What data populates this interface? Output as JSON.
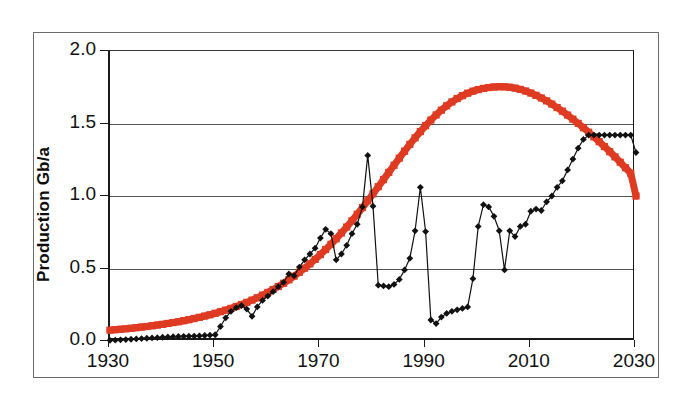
{
  "chart_data": {
    "type": "line",
    "title": "",
    "xlabel": "",
    "ylabel": "Production Gb/a",
    "xlim": [
      1930,
      2030
    ],
    "ylim": [
      0.0,
      2.0
    ],
    "grid": true,
    "legend": "none",
    "xticks": [
      1930,
      1950,
      1970,
      1990,
      2010,
      2030
    ],
    "xtick_labels": [
      "1930",
      "1950",
      "1970",
      "1990",
      "2010",
      "2030"
    ],
    "yticks": [
      0.0,
      0.5,
      1.0,
      1.5,
      2.0
    ],
    "ytick_labels": [
      "0.0",
      "0.5",
      "1.0",
      "1.5",
      "2.0"
    ],
    "colors": {
      "series_red": "#DE3B22",
      "series_black": "#111111",
      "gridline": "#555555",
      "axis": "#1a1a1a",
      "frame": "#6b6b6b",
      "background": "#ffffff"
    },
    "series": [
      {
        "name": "red-model-curve",
        "color": "#DE3B22",
        "marker": "square",
        "line_width": 7,
        "x": [
          1930,
          1931,
          1932,
          1933,
          1934,
          1935,
          1936,
          1937,
          1938,
          1939,
          1940,
          1941,
          1942,
          1943,
          1944,
          1945,
          1946,
          1947,
          1948,
          1949,
          1950,
          1951,
          1952,
          1953,
          1954,
          1955,
          1956,
          1957,
          1958,
          1959,
          1960,
          1961,
          1962,
          1963,
          1964,
          1965,
          1966,
          1967,
          1968,
          1969,
          1970,
          1971,
          1972,
          1973,
          1974,
          1975,
          1976,
          1977,
          1978,
          1979,
          1980,
          1981,
          1982,
          1983,
          1984,
          1985,
          1986,
          1987,
          1988,
          1989,
          1990,
          1991,
          1992,
          1993,
          1994,
          1995,
          1996,
          1997,
          1998,
          1999,
          2000,
          2001,
          2002,
          2003,
          2004,
          2005,
          2006,
          2007,
          2008,
          2009,
          2010,
          2011,
          2012,
          2013,
          2014,
          2015,
          2016,
          2017,
          2018,
          2019,
          2020,
          2021,
          2022,
          2023,
          2024,
          2025,
          2026,
          2027,
          2028,
          2029,
          2030
        ],
        "y": [
          0.075,
          0.078,
          0.081,
          0.084,
          0.088,
          0.092,
          0.096,
          0.1,
          0.105,
          0.11,
          0.115,
          0.121,
          0.127,
          0.133,
          0.14,
          0.147,
          0.155,
          0.163,
          0.172,
          0.181,
          0.191,
          0.202,
          0.213,
          0.225,
          0.238,
          0.252,
          0.266,
          0.282,
          0.298,
          0.316,
          0.335,
          0.355,
          0.376,
          0.398,
          0.422,
          0.447,
          0.474,
          0.502,
          0.532,
          0.563,
          0.596,
          0.631,
          0.667,
          0.705,
          0.745,
          0.786,
          0.829,
          0.874,
          0.92,
          0.967,
          1.015,
          1.064,
          1.113,
          1.163,
          1.212,
          1.261,
          1.309,
          1.356,
          1.401,
          1.444,
          1.485,
          1.524,
          1.559,
          1.592,
          1.622,
          1.649,
          1.672,
          1.692,
          1.709,
          1.723,
          1.734,
          1.742,
          1.748,
          1.752,
          1.754,
          1.753,
          1.75,
          1.744,
          1.735,
          1.724,
          1.71,
          1.694,
          1.676,
          1.656,
          1.634,
          1.61,
          1.585,
          1.558,
          1.53,
          1.501,
          1.471,
          1.44,
          1.408,
          1.375,
          1.341,
          1.306,
          1.27,
          1.233,
          1.195,
          1.157,
          1.0
        ]
      },
      {
        "name": "black-historical-curve",
        "color": "#111111",
        "marker": "diamond",
        "line_width": 1.2,
        "x": [
          1930,
          1931,
          1932,
          1933,
          1934,
          1935,
          1936,
          1937,
          1938,
          1939,
          1940,
          1941,
          1942,
          1943,
          1944,
          1945,
          1946,
          1947,
          1948,
          1949,
          1950,
          1951,
          1952,
          1953,
          1954,
          1955,
          1956,
          1957,
          1958,
          1959,
          1960,
          1961,
          1962,
          1963,
          1964,
          1965,
          1966,
          1967,
          1968,
          1969,
          1970,
          1971,
          1972,
          1973,
          1974,
          1975,
          1976,
          1977,
          1978,
          1979,
          1980,
          1981,
          1982,
          1983,
          1984,
          1985,
          1986,
          1987,
          1988,
          1989,
          1990,
          1991,
          1992,
          1993,
          1994,
          1995,
          1996,
          1997,
          1998,
          1999,
          2000,
          2001,
          2002,
          2003,
          2004,
          2005,
          2006,
          2007,
          2008,
          2009,
          2010,
          2011,
          2012,
          2013,
          2014,
          2015,
          2016,
          2017,
          2018,
          2019,
          2020,
          2021,
          2022,
          2023,
          2024,
          2025,
          2026,
          2027,
          2028,
          2029,
          2030
        ],
        "y": [
          0.005,
          0.006,
          0.008,
          0.01,
          0.012,
          0.014,
          0.017,
          0.019,
          0.021,
          0.023,
          0.026,
          0.028,
          0.03,
          0.031,
          0.032,
          0.033,
          0.034,
          0.036,
          0.038,
          0.04,
          0.043,
          0.1,
          0.16,
          0.205,
          0.23,
          0.245,
          0.22,
          0.17,
          0.235,
          0.28,
          0.31,
          0.34,
          0.375,
          0.405,
          0.462,
          0.45,
          0.51,
          0.56,
          0.6,
          0.64,
          0.71,
          0.77,
          0.74,
          0.56,
          0.6,
          0.66,
          0.74,
          0.805,
          0.925,
          1.28,
          0.93,
          0.385,
          0.38,
          0.375,
          0.39,
          0.425,
          0.49,
          0.57,
          0.76,
          1.06,
          0.755,
          0.145,
          0.12,
          0.165,
          0.19,
          0.205,
          0.215,
          0.225,
          0.235,
          0.43,
          0.79,
          0.94,
          0.925,
          0.86,
          0.76,
          0.49,
          0.76,
          0.72,
          0.79,
          0.805,
          0.895,
          0.91,
          0.9,
          0.96,
          1.0,
          1.06,
          1.105,
          1.18,
          1.255,
          1.33,
          1.39,
          1.42,
          1.42,
          1.42,
          1.42,
          1.42,
          1.42,
          1.42,
          1.42,
          1.42,
          1.3
        ]
      }
    ]
  }
}
